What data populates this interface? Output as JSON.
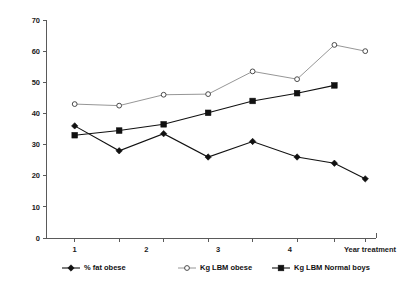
{
  "chart_data": {
    "type": "line",
    "title": "",
    "xlabel": "Year treatment",
    "ylabel": "",
    "ylim": [
      0,
      70
    ],
    "ytick_step": 10,
    "yticks": [
      "0",
      "10",
      "20",
      "30",
      "40",
      "50",
      "60",
      "70"
    ],
    "xticks": [
      "1",
      "2",
      "3",
      "4"
    ],
    "xtick_values": [
      1,
      2,
      3,
      4
    ],
    "xlim": [
      0.6,
      5.2
    ],
    "grid": false,
    "legend_position": "bottom",
    "x": [
      1.0,
      1.62,
      2.24,
      2.86,
      3.48,
      4.1,
      4.62,
      5.05
    ],
    "series": [
      {
        "name": "% fat obese",
        "marker": "filled-diamond",
        "color": "#111111",
        "values": [
          36,
          28,
          33.5,
          26,
          31,
          26,
          24,
          19
        ]
      },
      {
        "name": "Kg LBM obese",
        "marker": "open-circle",
        "color": "#8a8a8a",
        "values": [
          43,
          42.5,
          46,
          46.2,
          53.5,
          51,
          62,
          60
        ]
      },
      {
        "name": "Kg LBM Normal boys",
        "marker": "filled-square",
        "color": "#111111",
        "values": [
          33,
          34.5,
          36.5,
          40.2,
          44,
          46.5,
          49,
          null
        ]
      }
    ]
  },
  "legend": {
    "items": [
      {
        "label": "% fat obese",
        "marker": "filled-diamond"
      },
      {
        "label": "Kg LBM obese",
        "marker": "open-circle"
      },
      {
        "label": "Kg LBM Normal boys",
        "marker": "filled-square"
      }
    ]
  },
  "axis": {
    "x_title": "Year treatment"
  }
}
